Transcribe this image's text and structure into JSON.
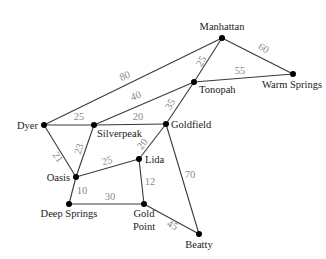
{
  "diagram": {
    "type": "weighted-undirected-graph",
    "nodes": [
      {
        "id": "manhattan",
        "label": "Manhattan",
        "x": 222,
        "y": 38,
        "lx": 222,
        "ly": 30,
        "anchor": "middle"
      },
      {
        "id": "tonopah",
        "label": "Tonopah",
        "x": 194,
        "y": 82,
        "lx": 199,
        "ly": 93,
        "anchor": "start"
      },
      {
        "id": "warm_springs",
        "label": "Warm Springs",
        "x": 293,
        "y": 74,
        "lx": 292,
        "ly": 88,
        "anchor": "middle"
      },
      {
        "id": "dyer",
        "label": "Dyer",
        "x": 44,
        "y": 125,
        "lx": 38,
        "ly": 129,
        "anchor": "end"
      },
      {
        "id": "silverpeak",
        "label": "Silverpeak",
        "x": 94,
        "y": 125,
        "lx": 97,
        "ly": 137,
        "anchor": "start"
      },
      {
        "id": "goldfield",
        "label": "Goldfield",
        "x": 166,
        "y": 124,
        "lx": 171,
        "ly": 128,
        "anchor": "start"
      },
      {
        "id": "lida",
        "label": "Lida",
        "x": 139,
        "y": 159,
        "lx": 145,
        "ly": 163,
        "anchor": "start"
      },
      {
        "id": "oasis",
        "label": "Oasis",
        "x": 76,
        "y": 177,
        "lx": 70,
        "ly": 181,
        "anchor": "end"
      },
      {
        "id": "deep_springs",
        "label": "Deep Springs",
        "x": 69,
        "y": 204,
        "lx": 69,
        "ly": 217,
        "anchor": "middle"
      },
      {
        "id": "gold_point",
        "label": "Gold",
        "label2": "Point",
        "x": 144,
        "y": 204,
        "lx": 144,
        "ly": 217,
        "ly2": 230,
        "anchor": "middle"
      },
      {
        "id": "beatty",
        "label": "Beatty",
        "x": 199,
        "y": 234,
        "lx": 199,
        "ly": 248,
        "anchor": "middle"
      }
    ],
    "edges": [
      {
        "from": "dyer",
        "to": "manhattan",
        "weight": "80",
        "wx": 126,
        "wy": 79,
        "rot": -22
      },
      {
        "from": "silverpeak",
        "to": "tonopah",
        "weight": "40",
        "wx": 137,
        "wy": 99,
        "rot": -21
      },
      {
        "from": "dyer",
        "to": "silverpeak",
        "weight": "25",
        "wx": 79,
        "wy": 120,
        "rot": 0
      },
      {
        "from": "silverpeak",
        "to": "goldfield",
        "weight": "20",
        "wx": 138,
        "wy": 120,
        "rot": 0
      },
      {
        "from": "manhattan",
        "to": "tonopah",
        "weight": "25",
        "wx": 204,
        "wy": 63,
        "rot": -60
      },
      {
        "from": "manhattan",
        "to": "warm_springs",
        "weight": "60",
        "wx": 262,
        "wy": 51,
        "rot": 30
      },
      {
        "from": "tonopah",
        "to": "warm_springs",
        "weight": "55",
        "wx": 240,
        "wy": 74,
        "rot": 0
      },
      {
        "from": "tonopah",
        "to": "goldfield",
        "weight": "35",
        "wx": 173,
        "wy": 106,
        "rot": -60
      },
      {
        "from": "dyer",
        "to": "oasis",
        "weight": "21",
        "wx": 55,
        "wy": 159,
        "rot": 55
      },
      {
        "from": "silverpeak",
        "to": "oasis",
        "weight": "23",
        "wx": 82,
        "wy": 150,
        "rot": -72
      },
      {
        "from": "oasis",
        "to": "lida",
        "weight": "25",
        "wx": 108,
        "wy": 164,
        "rot": -17
      },
      {
        "from": "goldfield",
        "to": "lida",
        "weight": "20",
        "wx": 145,
        "wy": 146,
        "rot": -52
      },
      {
        "from": "goldfield",
        "to": "beatty",
        "weight": "70",
        "wx": 190,
        "wy": 178,
        "rot": 0
      },
      {
        "from": "oasis",
        "to": "deep_springs",
        "weight": "10",
        "wx": 82,
        "wy": 194,
        "rot": 0
      },
      {
        "from": "lida",
        "to": "gold_point",
        "weight": "12",
        "wx": 150,
        "wy": 185,
        "rot": 0
      },
      {
        "from": "deep_springs",
        "to": "gold_point",
        "weight": "30",
        "wx": 110,
        "wy": 200,
        "rot": 0
      },
      {
        "from": "gold_point",
        "to": "beatty",
        "weight": "45",
        "wx": 171,
        "wy": 228,
        "rot": 28
      }
    ]
  }
}
